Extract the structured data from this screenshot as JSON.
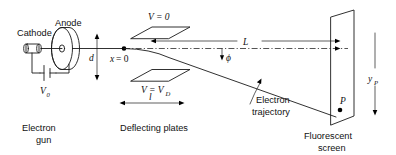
{
  "figure": {
    "type": "physics-schematic",
    "background_color": "#ffffff",
    "ink_color": "#1a1a1a"
  },
  "electron_gun": {
    "cathode_label": "Cathode",
    "anode_label": "Anode",
    "source_voltage": "V",
    "source_voltage_sub": "0",
    "group_label_line1": "Electron",
    "group_label_line2": "gun"
  },
  "beam": {
    "origin_label": "x = 0",
    "origin_label_x": "x",
    "origin_label_eq": "= 0",
    "gap_dimension": "d"
  },
  "plates": {
    "top_voltage": "V = 0",
    "bottom_voltage_v": "V = V",
    "bottom_voltage_sub": "D",
    "length_dimension": "l",
    "group_label": "Deflecting plates"
  },
  "drift": {
    "length_dimension": "L",
    "angle_label": "ϕ",
    "trajectory_label_line1": "Electron",
    "trajectory_label_line2": "trajectory"
  },
  "screen": {
    "impact_point": "P",
    "deflection_label": "y",
    "deflection_sub": "P",
    "group_label_line1": "Fluorescent",
    "group_label_line2": "screen"
  }
}
